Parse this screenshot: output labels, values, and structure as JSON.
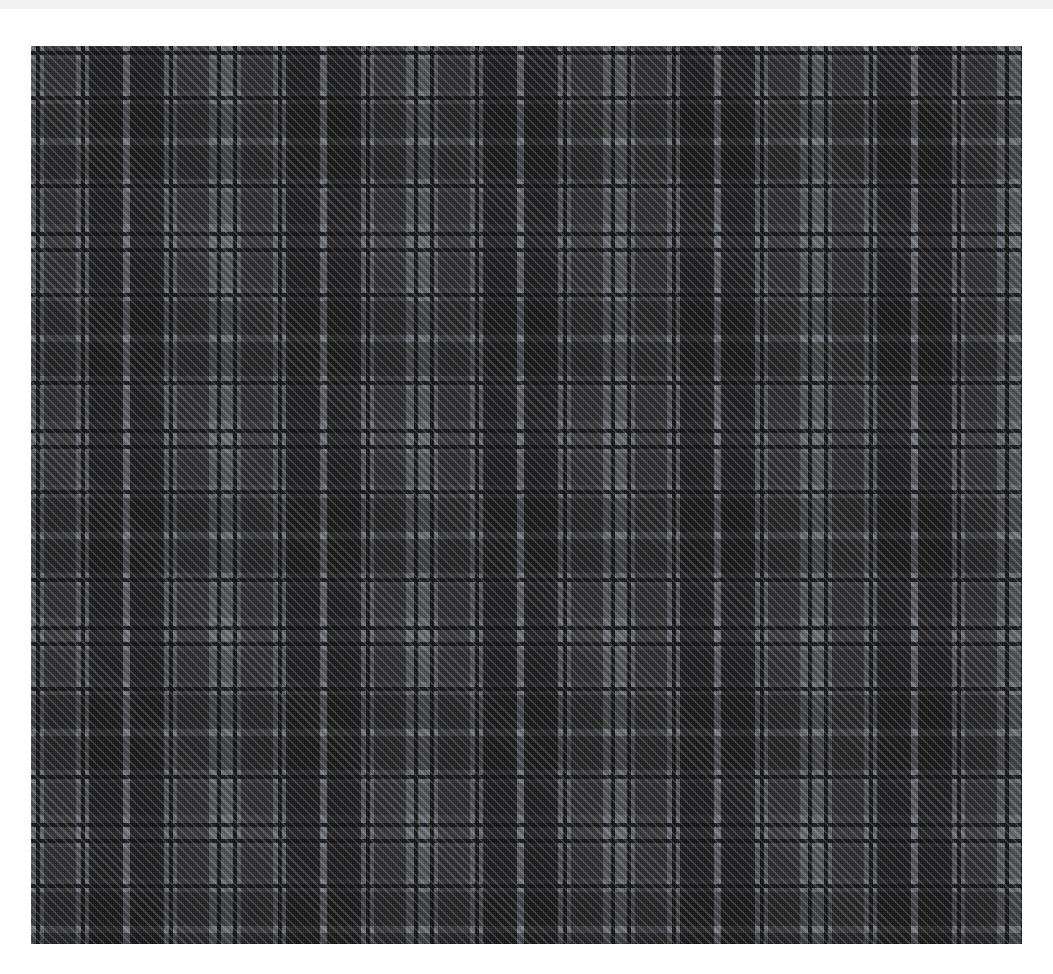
{
  "page": {
    "background_color": "#ffffff",
    "width": 1053,
    "height": 974
  },
  "top_remnant": {
    "name": "cropped-text-remnant",
    "visible_text": "",
    "background_color": "#f2f2f2"
  },
  "swatch": {
    "title": "",
    "x": 31,
    "y": 46,
    "width": 991,
    "height": 898,
    "material": "woven wool tartan",
    "weave": "2/2 twill",
    "twill_angle_degrees": 45,
    "sett_repeat_px": 197,
    "symmetry": "symmetric (reflective) sett",
    "palette": {
      "lightest_grey": "#9a9da2",
      "light_grey": "#8d9095",
      "mid_grey": "#4a4a4d",
      "dark_grey": "#2e2e31",
      "near_black": "#19191b",
      "guard_line_black": "#0c0c0d"
    },
    "sett_threadcount": [
      {
        "color_name": "light_grey",
        "color": "#8d9095",
        "width_px": 13,
        "guard_line": true
      },
      {
        "color_name": "mid_grey",
        "color": "#4a4a4d",
        "width_px": 32,
        "guard_line": false
      },
      {
        "color_name": "light_grey",
        "color": "#8d9095",
        "width_px": 13,
        "guard_line": true
      },
      {
        "color_name": "dark_grey",
        "color": "#2e2e31",
        "width_px": 34,
        "guard_line": false
      },
      {
        "color_name": "lightest_grey",
        "color": "#9a9da2",
        "width_px": 7,
        "guard_line": false
      },
      {
        "color_name": "dark_grey",
        "color": "#2e2e31",
        "width_px": 34,
        "guard_line": false
      },
      {
        "color_name": "light_grey",
        "color": "#8d9095",
        "width_px": 13,
        "guard_line": true
      },
      {
        "color_name": "mid_grey",
        "color": "#4a4a4d",
        "width_px": 32,
        "guard_line": false
      },
      {
        "color_name": "light_grey",
        "color": "#8d9095",
        "width_px": 19,
        "guard_line": true
      }
    ],
    "repeats_horizontal": 5,
    "repeats_vertical": 4.6
  }
}
